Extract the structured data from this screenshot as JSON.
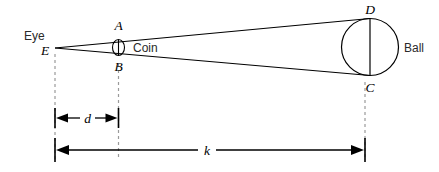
{
  "figure": {
    "background_color": "#ffffff",
    "line_color": "#000000",
    "dashed_color": "#9a9a9a"
  },
  "labels": {
    "eye_word": "Eye",
    "eye_point": "E",
    "coin_top": "A",
    "coin_bottom": "B",
    "coin_word": "Coin",
    "ball_top": "D",
    "ball_bottom": "C",
    "ball_word": "Ball"
  },
  "dimensions": {
    "short": "d",
    "long": "k"
  },
  "geometry": {
    "eye": {
      "x": 55,
      "y": 48
    },
    "coin": {
      "cx": 118.5,
      "cy": 47.5,
      "rx": 6,
      "ry": 8
    },
    "ball": {
      "cx": 370,
      "cy": 47,
      "r": 28.5
    },
    "ball_top_point": {
      "x": 370,
      "y": 18.5
    },
    "ball_bottom_point": {
      "x": 370,
      "y": 75.5
    },
    "dim_d": {
      "y": 118,
      "x1": 55,
      "x2": 118.5
    },
    "dim_k": {
      "y": 150,
      "x1": 55,
      "x2": 365
    }
  }
}
